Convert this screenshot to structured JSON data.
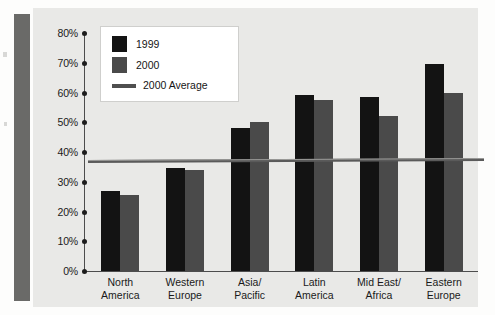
{
  "chart_data": {
    "type": "bar",
    "title": "",
    "xlabel": "",
    "ylabel": "",
    "ylim": [
      0,
      80
    ],
    "grid": false,
    "legend_position": "top-left-inside",
    "categories": [
      "North\nAmerica",
      "Western\nEurope",
      "Asia/\nPacific",
      "Latin\nAmerica",
      "Mid East/\nAfrica",
      "Eastern\nEurope"
    ],
    "category_lines": [
      [
        "North",
        "America"
      ],
      [
        "Western",
        "Europe"
      ],
      [
        "Asia/",
        "Pacific"
      ],
      [
        "Latin",
        "America"
      ],
      [
        "Mid East/",
        "Africa"
      ],
      [
        "Eastern",
        "Europe"
      ]
    ],
    "ytick_labels": [
      "80%",
      "70%",
      "60%",
      "50%",
      "40%",
      "30%",
      "20%",
      "10%",
      "0%"
    ],
    "ytick_values": [
      80,
      70,
      60,
      50,
      40,
      30,
      20,
      10,
      0
    ],
    "series": [
      {
        "name": "1999",
        "color": "#131313",
        "values": [
          27,
          34.5,
          48,
          59,
          58.5,
          69.5
        ]
      },
      {
        "name": "2000",
        "color": "#4a4a4a",
        "values": [
          25.5,
          34,
          50,
          57.5,
          52,
          60
        ]
      }
    ],
    "reference_line": {
      "name": "2000 Average",
      "value": 37,
      "color": "#5a5a5a"
    },
    "legend": [
      {
        "label": "1999",
        "marker": "box",
        "color": "#131313"
      },
      {
        "label": "2000",
        "marker": "box",
        "color": "#4a4a4a"
      },
      {
        "label": "2000 Average",
        "marker": "line",
        "color": "#5a5a5a"
      }
    ]
  },
  "colors": {
    "series_1999": "#131313",
    "series_2000": "#4a4a4a",
    "average_line": "#5a5a5a",
    "chart_background": "#e9e9e7",
    "page_background": "#fdfdfc",
    "sidebar_rule": "#6a6a68",
    "axis": "#4d4d4d",
    "text": "#1a1a1a"
  }
}
